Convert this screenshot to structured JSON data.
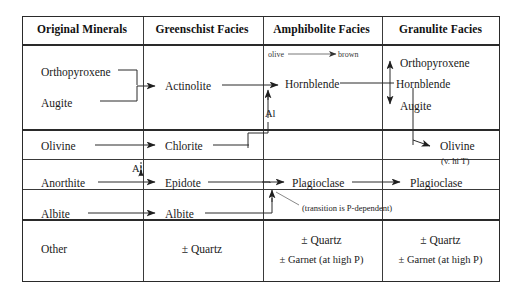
{
  "figure": {
    "type": "metamorphic-facies-mineral-table",
    "columns": [
      {
        "id": "original",
        "label": "Original Minerals"
      },
      {
        "id": "greenschist",
        "label": "Greenschist Facies"
      },
      {
        "id": "amphibolite",
        "label": "Amphibolite Facies"
      },
      {
        "id": "granulite",
        "label": "Granulite Facies"
      }
    ],
    "rows": [
      {
        "id": "pyroxene-row",
        "original": [
          "Orthopyroxene",
          "Augite"
        ],
        "greenschist": [
          "Actinolite"
        ],
        "amphibolite": [
          "Hornblende"
        ],
        "granulite": [
          "Orthopyroxene",
          "Hornblende",
          "Augite"
        ],
        "annotations": [
          "olive",
          "brown"
        ]
      },
      {
        "id": "olivine-row",
        "original": [
          "Olivine"
        ],
        "greenschist": [
          "Chlorite"
        ],
        "amphibolite": [],
        "granulite": [
          "Olivine"
        ],
        "annotations": [
          "(v. hi T)"
        ]
      },
      {
        "id": "anorthite-row",
        "original": [
          "Anorthite"
        ],
        "greenschist": [
          "Epidote"
        ],
        "amphibolite": [
          "Plagioclase"
        ],
        "granulite": [
          "Plagioclase"
        ],
        "annotations": []
      },
      {
        "id": "albite-row",
        "original": [
          "Albite"
        ],
        "greenschist": [
          "Albite"
        ],
        "amphibolite": [],
        "granulite": [],
        "annotations": [
          "(transition is P-dependent)"
        ]
      },
      {
        "id": "other-row",
        "original": [
          "Other"
        ],
        "greenschist": [
          "± Quartz"
        ],
        "amphibolite": [
          "± Quartz",
          "± Garnet (at high P)"
        ],
        "granulite": [
          "± Quartz",
          "± Garnet (at high P)"
        ],
        "annotations": []
      }
    ],
    "labels": {
      "al_1": "Al",
      "al_2": "Al",
      "olive": "olive",
      "brown": "brown",
      "v_hi_t": "(v. hi T)",
      "transition": "(transition is P-dependent)"
    },
    "colors": {
      "frame": "#2a2a2a",
      "grid": "#3a3a3a",
      "text": "#1a1a1a",
      "arrow": "#2a2a2a",
      "annotation": "#3a3a3a",
      "background": "#ffffff"
    }
  }
}
